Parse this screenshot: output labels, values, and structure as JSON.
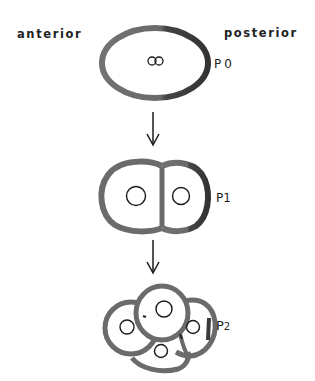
{
  "diagram": {
    "orientation": {
      "left_label": "anterior",
      "right_label": "posterior"
    },
    "stages": [
      {
        "id": "p0",
        "label": "P0",
        "description": "one-cell embryo with two pronuclei",
        "cells": 1,
        "nuclei": 2
      },
      {
        "id": "p1",
        "label": "P1",
        "description": "two-cell embryo",
        "cells": 2,
        "nuclei": 2
      },
      {
        "id": "p2",
        "label_main": "P",
        "label_sub": "2",
        "description": "four-cell embryo",
        "cells": 4,
        "nuclei": 4
      }
    ],
    "arrows": [
      {
        "from": "p0",
        "to": "p1"
      },
      {
        "from": "p1",
        "to": "p2"
      }
    ],
    "colors": {
      "cell_outline": "#6b6b6b",
      "cell_outline_dark": "#3a3a3a",
      "nucleus_outline": "#1a1a1a",
      "arrow": "#1a1a1a",
      "background": "#ffffff"
    }
  }
}
